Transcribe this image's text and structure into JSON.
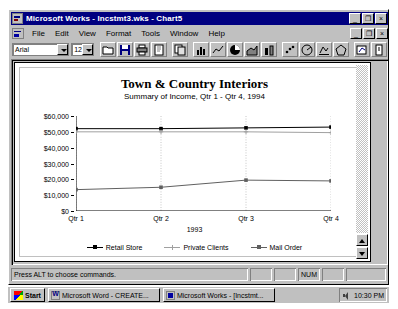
{
  "window": {
    "title": "Microsoft Works - Incstmt3.wks - Chart5",
    "app_icon": "works-icon",
    "doc_icon": "document-icon",
    "controls": {
      "minimize": "_",
      "restore": "❐",
      "close": "×"
    }
  },
  "menu": {
    "items": [
      {
        "label": "File"
      },
      {
        "label": "Edit"
      },
      {
        "label": "View"
      },
      {
        "label": "Format"
      },
      {
        "label": "Tools"
      },
      {
        "label": "Window"
      },
      {
        "label": "Help"
      }
    ]
  },
  "toolbar": {
    "font_name": "Arial",
    "font_size": "12",
    "buttons": [
      {
        "name": "open-icon"
      },
      {
        "name": "save-icon"
      },
      {
        "name": "print-icon"
      },
      {
        "name": "print-preview-icon"
      },
      {
        "name": "copy-icon"
      },
      {
        "name": "bar-chart-icon"
      },
      {
        "name": "line-chart-icon"
      },
      {
        "name": "pie-chart-icon"
      },
      {
        "name": "area-chart-icon"
      },
      {
        "name": "stacked-bar-chart-icon"
      },
      {
        "name": "xy-chart-icon"
      },
      {
        "name": "combo-chart-icon"
      },
      {
        "name": "3d-chart-icon"
      },
      {
        "name": "radar-chart-icon"
      },
      {
        "name": "insert-chart-icon"
      },
      {
        "name": "help-icon"
      }
    ]
  },
  "chart_data": {
    "type": "line",
    "title": "Town & Country Interiors",
    "subtitle": "Summary of Income, Qtr 1 - Qtr 4, 1994",
    "categories": [
      "Qtr 1",
      "Qtr 2",
      "Qtr 3",
      "Qtr 4"
    ],
    "xlabel": "1993",
    "ylabel": "",
    "ylim": [
      0,
      60000
    ],
    "ytick_values": [
      0,
      10000,
      20000,
      30000,
      40000,
      50000,
      60000
    ],
    "ytick_labels": [
      "$0",
      "$10,000",
      "$20,000",
      "$30,000",
      "$40,000",
      "$50,000",
      "$60,000"
    ],
    "grid": "vertical-dotted",
    "legend_position": "bottom",
    "series": [
      {
        "name": "Retail Store",
        "values": [
          52000,
          52000,
          52500,
          53000
        ],
        "color": "#000000",
        "marker": "square"
      },
      {
        "name": "Private Clients",
        "values": [
          50000,
          50000,
          50000,
          49500
        ],
        "color": "#a0a0a0",
        "marker": "plus"
      },
      {
        "name": "Mail Order",
        "values": [
          13500,
          15000,
          19500,
          19000
        ],
        "color": "#606060",
        "marker": "square"
      }
    ]
  },
  "status_bar": {
    "message": "Press ALT to choose commands.",
    "cells": [
      "",
      "",
      "NUM",
      "",
      ""
    ]
  },
  "taskbar": {
    "start_label": "Start",
    "tasks": [
      {
        "label": "Microsoft Word - CREATE...",
        "icon": "word-icon"
      },
      {
        "label": "Microsoft Works - [Incstmt...",
        "icon": "works-icon"
      }
    ],
    "tray": {
      "speaker_icon": "speaker-icon",
      "clock": "10:30 PM"
    }
  }
}
